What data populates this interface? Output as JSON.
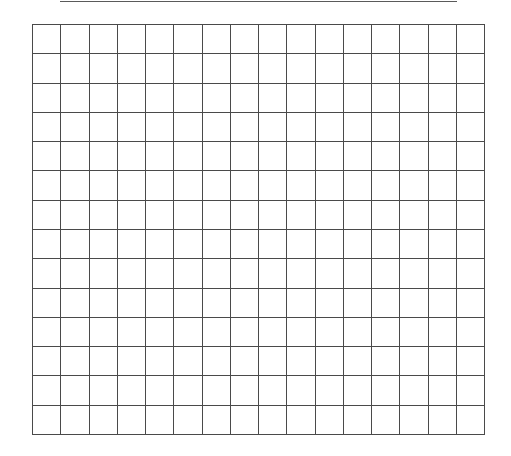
{
  "page": {
    "type": "blank grid worksheet",
    "top_rule": {
      "present": true,
      "color": "#5a5a5a"
    },
    "grid": {
      "columns": 16,
      "rows": 14,
      "line_color": "#4a4a4a",
      "background": "#ffffff",
      "cells": []
    }
  }
}
